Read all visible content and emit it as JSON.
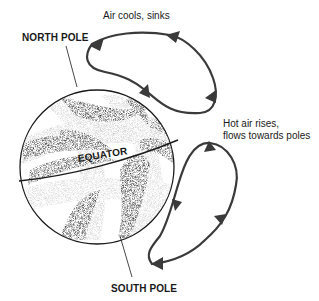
{
  "diagram": {
    "labels": {
      "north_pole": "NORTH POLE",
      "south_pole": "SOUTH POLE",
      "equator": "EQUATOR",
      "air_cools": "Air cools, sinks",
      "hot_air_line1": "Hot air rises,",
      "hot_air_line2": "flows towards poles"
    },
    "colors": {
      "ink": "#1a1a1a",
      "arrow": "#3a3a3a",
      "stipple_dark": "#2b2b2b",
      "stipple_light": "#bdbdbd",
      "background": "#ffffff"
    },
    "cells": [
      {
        "name": "northern-circulation-cell",
        "direction": "clockwise-loop",
        "arrows": 4
      },
      {
        "name": "southern-circulation-cell",
        "direction": "counterclockwise-loop",
        "arrows": 4
      }
    ]
  }
}
